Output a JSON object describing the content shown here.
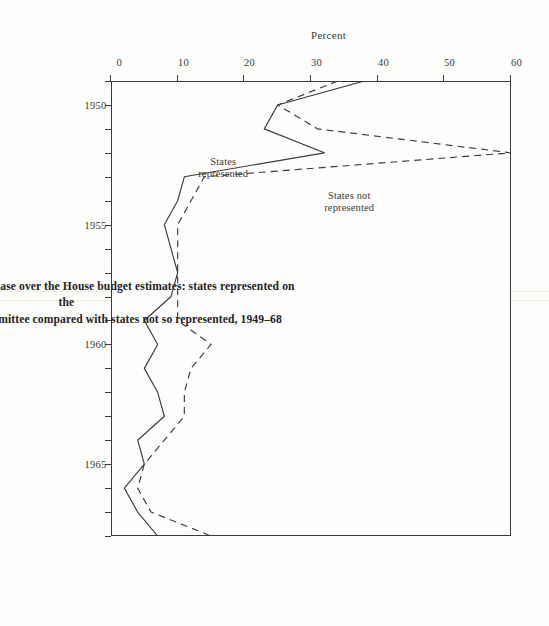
{
  "figure": {
    "number": "Fig. 10.1",
    "caption_line1": "Fig. 10.1  Percent of Senate increase over the House budget estimates: states represented on the",
    "caption_line2": "S.A.C. Public Works Subcommittee compared with states not so represented, 1949–68"
  },
  "annotations": {
    "not_represented_l1": "States not",
    "not_represented_l2": "represented",
    "represented_l1": "States",
    "represented_l2": "represented"
  },
  "colors": {
    "ink": "#3a3a3a",
    "paper": "#fefefe",
    "seam": "#ececd8"
  },
  "chart_data": {
    "type": "line",
    "title": "Percent of Senate increase over the House budget estimates",
    "xlabel": "",
    "ylabel": "Percent",
    "xlim": [
      1949,
      1968
    ],
    "ylim": [
      0,
      60
    ],
    "grid": false,
    "legend": "in-plot annotations",
    "orientation": "figure printed rotated 90 degrees on the scanned page",
    "x_tick_labels": [
      "1950",
      "1955",
      "1960",
      "1965"
    ],
    "x_tick_values": [
      1950,
      1955,
      1960,
      1965
    ],
    "x_minor_ticks": [
      1949,
      1950,
      1951,
      1952,
      1953,
      1954,
      1955,
      1956,
      1957,
      1958,
      1959,
      1960,
      1961,
      1962,
      1963,
      1964,
      1965,
      1966,
      1967,
      1968
    ],
    "y_tick_labels": [
      "0",
      "10",
      "20",
      "30",
      "40",
      "50",
      "60"
    ],
    "y_tick_values": [
      0,
      10,
      20,
      30,
      40,
      50,
      60
    ],
    "x": [
      1949,
      1950,
      1951,
      1952,
      1953,
      1954,
      1955,
      1956,
      1957,
      1958,
      1959,
      1960,
      1961,
      1962,
      1963,
      1964,
      1965,
      1966,
      1967,
      1968
    ],
    "series": [
      {
        "name": "States represented",
        "style": "solid",
        "values": [
          38,
          25,
          23,
          32,
          11,
          10,
          8,
          9,
          10,
          9,
          5,
          7,
          5,
          7,
          8,
          4,
          5,
          2,
          4,
          7
        ]
      },
      {
        "name": "States not represented",
        "style": "dashed",
        "values": [
          34,
          25,
          31,
          60,
          14,
          12,
          10,
          10,
          10,
          10,
          10,
          15,
          12,
          11,
          11,
          8,
          5,
          4,
          6,
          15
        ]
      }
    ]
  }
}
